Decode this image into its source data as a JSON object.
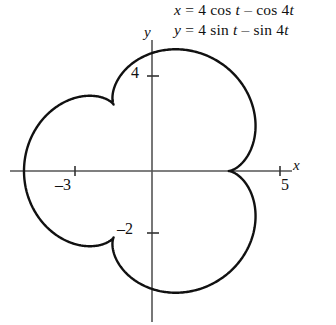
{
  "figure": {
    "equation_x": "x = 4 cos t – cos 4t",
    "equation_y": "y = 4 sin t – sin 4t",
    "eq_x_parts": {
      "lhs": "x",
      "rhs_a": " = 4 cos ",
      "var": "t",
      "rhs_b": " – cos 4",
      "var2": "t"
    },
    "eq_y_parts": {
      "lhs": "y",
      "rhs_a": " = 4 sin ",
      "var": "t",
      "rhs_b": " – sin 4",
      "var2": "t"
    },
    "axis_label_x": "x",
    "axis_label_y": "y",
    "tick_y_4": "4",
    "tick_y_neg2": "–2",
    "tick_x_neg3": "–3",
    "tick_x_5": "5",
    "curve_color": "#111111",
    "axis_color": "#555555",
    "background": "#ffffff"
  },
  "chart_data": {
    "type": "line",
    "title": "",
    "subtitle": "",
    "xlabel": "x",
    "ylabel": "y",
    "grid": false,
    "legend": null,
    "parametric": true,
    "parameter": "t",
    "parameter_range": [
      0,
      6.283185307179586
    ],
    "equations": {
      "x": "4*cos(t) - cos(4*t)",
      "y": "4*sin(t) - sin(4*t)"
    },
    "curve_name": "epitrochoid",
    "lobes": 3,
    "xlim": [
      -5.2,
      5.6
    ],
    "ylim": [
      -5.2,
      4.8
    ],
    "xticks": [
      -3,
      5
    ],
    "xtick_labels": [
      "–3",
      "5"
    ],
    "yticks": [
      4,
      -2
    ],
    "ytick_labels": [
      "4",
      "–2"
    ],
    "annotations": [
      {
        "text": "x = 4 cos t – cos 4t",
        "position": "top-right"
      },
      {
        "text": "y = 4 sin t – sin 4t",
        "position": "top-right"
      }
    ],
    "notable_points": [
      {
        "label": "x-axis crossing right",
        "x": 5,
        "y": 0
      },
      {
        "label": "leftmost extent",
        "x": -5,
        "y": 0
      },
      {
        "label": "top extent",
        "x": 0,
        "y": 4.6
      },
      {
        "label": "bottom extent",
        "x": -0.1,
        "y": -4.9
      }
    ],
    "x": [
      5,
      4.87,
      4.5,
      3.93,
      3.25,
      2.56,
      1.97,
      1.55,
      1.35,
      1.41,
      1.73,
      2.27,
      2.95,
      3.65,
      4.26,
      4.67,
      4.78,
      4.57,
      4.04,
      3.22,
      2.2,
      1.07,
      -0.07,
      -1.14,
      -2.08,
      -2.83,
      -3.37,
      -3.7,
      -3.84,
      -3.86,
      -3.83,
      -3.84,
      -3.98,
      -4.3,
      -4.8,
      -5.0,
      -4.3,
      -3.5,
      -2.8,
      -2.2,
      -1.6,
      -1.0,
      -0.4,
      0.2,
      0.9,
      1.7,
      2.6,
      3.5,
      4.2,
      4.7,
      5
    ],
    "y": [
      0,
      0.63,
      1.26,
      1.86,
      2.4,
      2.85,
      3.2,
      3.45,
      3.62,
      3.76,
      3.91,
      4.08,
      4.26,
      4.4,
      4.45,
      4.36,
      4.1,
      3.68,
      3.13,
      2.5,
      1.85,
      1.23,
      0.7,
      0.3,
      0.06,
      0.0,
      0.12,
      0.4,
      0.8,
      1.25,
      1.68,
      2.0,
      2.15,
      2.05,
      1.5,
      0,
      -1.5,
      -2.6,
      -3.3,
      -3.6,
      -3.5,
      -3.1,
      -2.6,
      -2.1,
      -1.8,
      -1.7,
      -1.9,
      -2.4,
      -3.0,
      -3.6,
      -4.0
    ]
  }
}
